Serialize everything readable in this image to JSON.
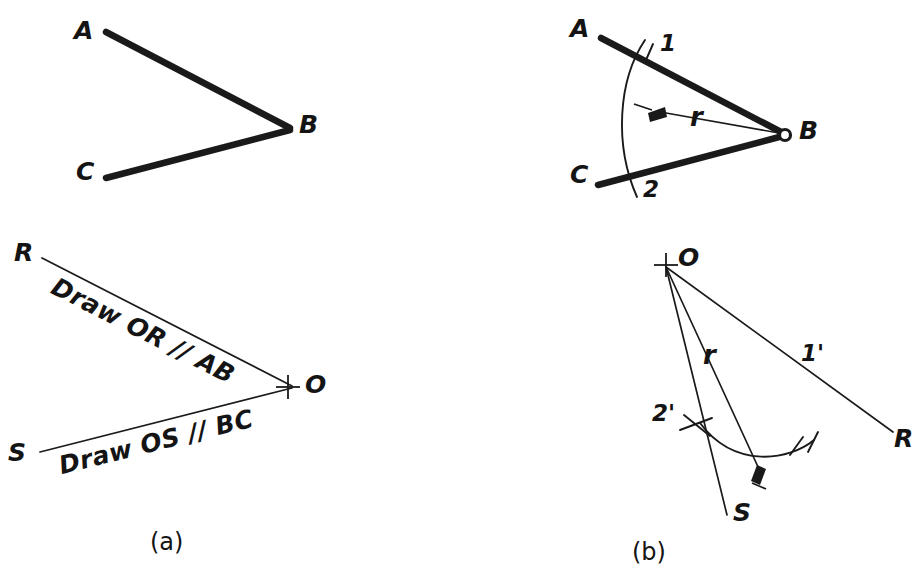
{
  "figure": {
    "title_caption_a": "(a)",
    "title_caption_b": "(b)",
    "background_color": "#ffffff",
    "ink_color": "#1a1a1a"
  },
  "panel_a_top": {
    "name": "given-angle-ABC",
    "labels": {
      "a": "A",
      "b": "B",
      "c": "C"
    }
  },
  "panel_b_top": {
    "name": "arc-struck-on-angle-ABC",
    "labels": {
      "a": "A",
      "b": "B",
      "c": "C",
      "point1": "1",
      "point2": "2",
      "radius": "r"
    }
  },
  "panel_a_bottom": {
    "name": "construct-parallel-lines-at-O",
    "labels": {
      "r": "R",
      "s": "S",
      "o": "O"
    },
    "notes": {
      "note_upper": "Draw OR // AB",
      "note_lower": "Draw OS // BC"
    }
  },
  "panel_b_bottom": {
    "name": "transfer-arc-to-new-vertex",
    "labels": {
      "o": "O",
      "r": "R",
      "s": "S",
      "point1": "1'",
      "point2": "2'",
      "radius": "r"
    }
  },
  "captions": {
    "a": "(a)",
    "b": "(b)"
  }
}
